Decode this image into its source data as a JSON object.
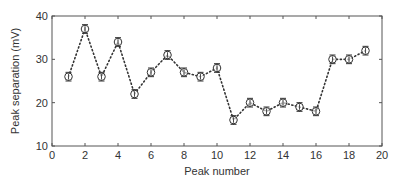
{
  "chart_data": {
    "type": "line",
    "title": "",
    "xlabel": "Peak number",
    "ylabel": "Peak separation (mV)",
    "xlim": [
      0,
      20
    ],
    "ylim": [
      10,
      40
    ],
    "xticks": [
      0,
      2,
      4,
      6,
      8,
      10,
      12,
      14,
      16,
      18,
      20
    ],
    "yticks": [
      10,
      20,
      30,
      40
    ],
    "grid": false,
    "legend": null,
    "line_style": "dotted",
    "marker": "open-circle-with-errorbar",
    "x": [
      1,
      2,
      3,
      4,
      5,
      6,
      7,
      8,
      9,
      10,
      11,
      12,
      13,
      14,
      15,
      16,
      17,
      18,
      19
    ],
    "series": [
      {
        "name": "Peak separation",
        "values": [
          26,
          37,
          26,
          34,
          22,
          27,
          31,
          27,
          26,
          28,
          16,
          20,
          18,
          20,
          19,
          18,
          30,
          30,
          32
        ],
        "error": [
          1,
          1,
          1,
          1,
          1,
          1,
          1,
          1,
          1,
          1,
          1,
          1,
          1,
          1,
          1,
          1,
          1,
          1,
          1
        ]
      }
    ]
  },
  "colors": {
    "line": "#333333",
    "marker": "#333333",
    "axis": "#555555",
    "background": "#ffffff"
  }
}
